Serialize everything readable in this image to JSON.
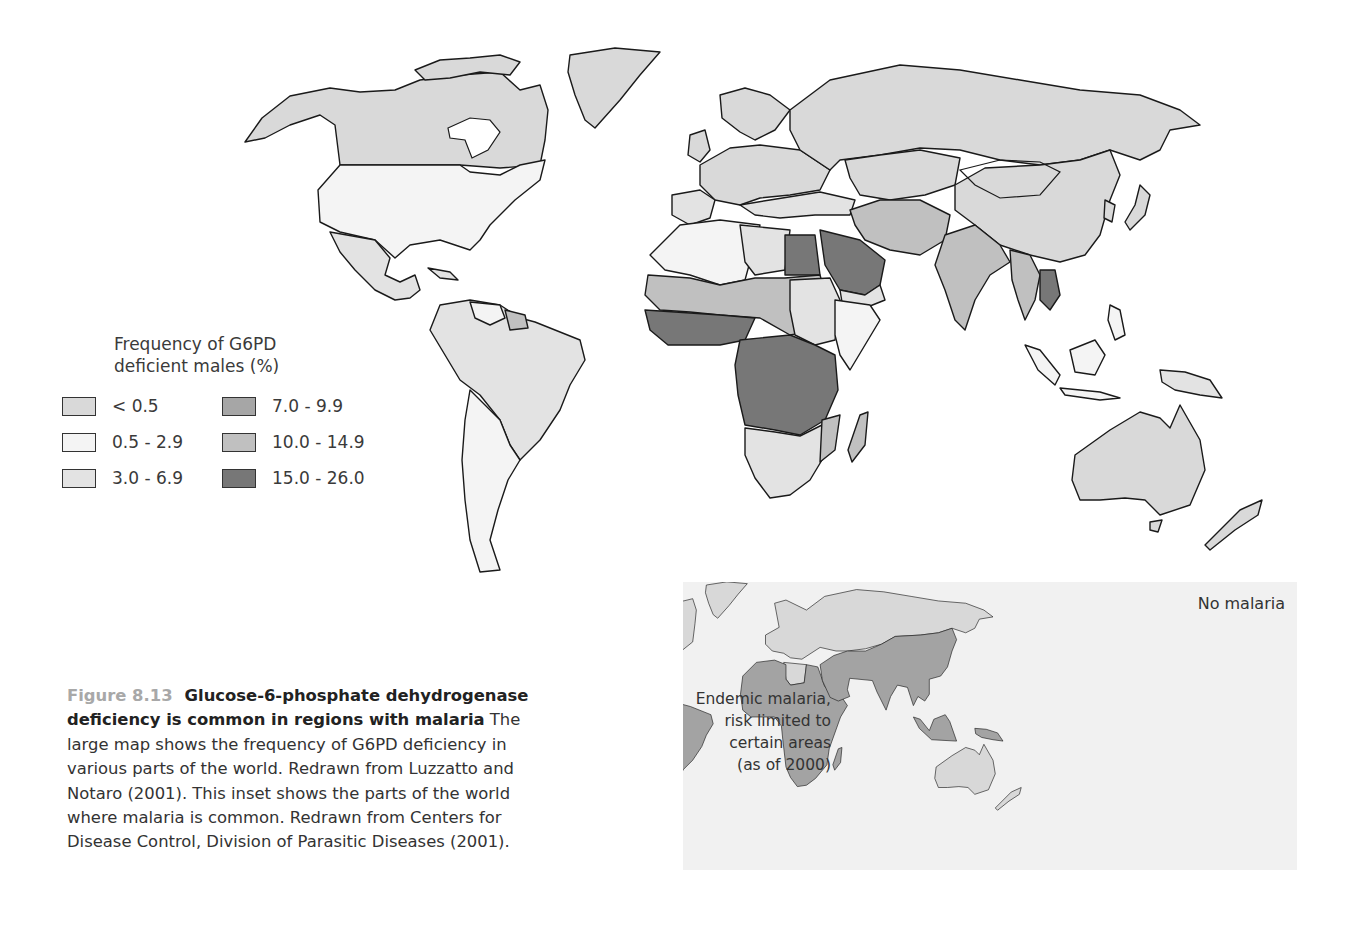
{
  "legend": {
    "title_line1": "Frequency of G6PD",
    "title_line2": "deficient males (%)",
    "items": [
      {
        "label": "< 0.5",
        "color": "#d9d9d9"
      },
      {
        "label": "7.0 - 9.9",
        "color": "#a6a6a6"
      },
      {
        "label": "0.5 - 2.9",
        "color": "#f4f4f4"
      },
      {
        "label": "10.0 - 14.9",
        "color": "#c0c0c0"
      },
      {
        "label": "3.0 - 6.9",
        "color": "#e3e3e3"
      },
      {
        "label": "15.0 - 26.0",
        "color": "#777777"
      }
    ]
  },
  "caption": {
    "figure_number": "Figure 8.13",
    "title": "Glucose-6-phosphate dehydrogenase deficiency is common in regions with malaria",
    "body": "The large map shows the frequency of G6PD deficiency in various parts of the world.  Redrawn from Luzzatto and Notaro (2001). This inset shows the parts of the world where malaria is common. Redrawn from Centers for Disease Control, Division of Parasitic Diseases (2001)."
  },
  "inset": {
    "no_malaria_label": "No malaria",
    "endemic_label_line1": "Endemic malaria,",
    "endemic_label_line2": "risk limited to",
    "endemic_label_line3": "certain areas",
    "endemic_label_line4": "(as of 2000)",
    "no_malaria_color": "#d8d8d8",
    "endemic_color": "#a3a3a3",
    "background": "#f1f1f1"
  },
  "map_regions": {
    "north_america_canada": "< 0.5",
    "usa": "0.5 - 2.9",
    "mexico_central_america": "3.0 - 6.9",
    "south_america_brazil": "3.0 - 6.9",
    "argentina_bolivia": "0.5 - 2.9",
    "greenland": "< 0.5",
    "europe_north": "< 0.5",
    "mediterranean": "3.0 - 6.9",
    "russia": "< 0.5",
    "china": "< 0.5",
    "north_africa_west": "0.5 - 2.9",
    "egypt_saudi_arabia": "15.0 - 26.0",
    "sahel": "10.0 - 14.9",
    "west_africa_coast": "15.0 - 26.0",
    "central_africa": "15.0 - 26.0",
    "ethiopia": "0.5 - 2.9",
    "southern_africa": "3.0 - 6.9",
    "madagascar": "10.0 - 14.9",
    "india": "10.0 - 14.9",
    "iran_afghanistan": "10.0 - 14.9",
    "southeast_asia_laos_cambodia": "15.0 - 26.0",
    "indonesia": "0.5 - 2.9",
    "australia": "< 0.5",
    "new_zealand": "< 0.5"
  }
}
